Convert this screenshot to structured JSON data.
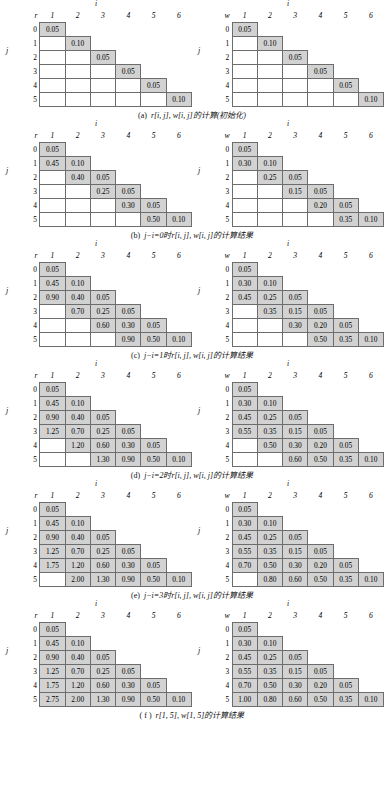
{
  "figure": {
    "col_headers": [
      "1",
      "2",
      "3",
      "4",
      "5",
      "6"
    ],
    "row_labels": [
      "0",
      "1",
      "2",
      "3",
      "4",
      "5"
    ],
    "axis_i": "i",
    "axis_j": "j",
    "symbol_r": "r",
    "symbol_w": "w"
  },
  "panels": [
    {
      "id": "a",
      "caption_label": "(a)",
      "caption_text": "r[i, j], w[i, j]的计算(初始化)",
      "left": {
        "corner": "r",
        "rows": [
          [
            "0.05",
            "",
            "",
            "",
            "",
            ""
          ],
          [
            "",
            "0.10",
            "",
            "",
            "",
            ""
          ],
          [
            "",
            "",
            "0.05",
            "",
            "",
            ""
          ],
          [
            "",
            "",
            "",
            "0.05",
            "",
            ""
          ],
          [
            "",
            "",
            "",
            "",
            "0.05",
            ""
          ],
          [
            "",
            "",
            "",
            "",
            "",
            "0.10"
          ]
        ]
      },
      "right": {
        "corner": "w",
        "rows": [
          [
            "0.05",
            "",
            "",
            "",
            "",
            ""
          ],
          [
            "",
            "0.10",
            "",
            "",
            "",
            ""
          ],
          [
            "",
            "",
            "0.05",
            "",
            "",
            ""
          ],
          [
            "",
            "",
            "",
            "0.05",
            "",
            ""
          ],
          [
            "",
            "",
            "",
            "",
            "0.05",
            ""
          ],
          [
            "",
            "",
            "",
            "",
            "",
            "0.10"
          ]
        ]
      }
    },
    {
      "id": "b",
      "caption_label": "(b)",
      "caption_text": "j−i=0时r[i, j], w[i, j]的计算结果",
      "left": {
        "corner": "r",
        "rows": [
          [
            "0.05",
            "",
            "",
            "",
            "",
            ""
          ],
          [
            "0.45",
            "0.10",
            "",
            "",
            "",
            ""
          ],
          [
            "",
            "0.40",
            "0.05",
            "",
            "",
            ""
          ],
          [
            "",
            "",
            "0.25",
            "0.05",
            "",
            ""
          ],
          [
            "",
            "",
            "",
            "0.30",
            "0.05",
            ""
          ],
          [
            "",
            "",
            "",
            "",
            "0.50",
            "0.10"
          ]
        ]
      },
      "right": {
        "corner": "w",
        "rows": [
          [
            "0.05",
            "",
            "",
            "",
            "",
            ""
          ],
          [
            "0.30",
            "0.10",
            "",
            "",
            "",
            ""
          ],
          [
            "",
            "0.25",
            "0.05",
            "",
            "",
            ""
          ],
          [
            "",
            "",
            "0.15",
            "0.05",
            "",
            ""
          ],
          [
            "",
            "",
            "",
            "0.20",
            "0.05",
            ""
          ],
          [
            "",
            "",
            "",
            "",
            "0.35",
            "0.10"
          ]
        ]
      }
    },
    {
      "id": "c",
      "caption_label": "(c)",
      "caption_text": "j−i=1时r[i, j], w[i, j]的计算结果",
      "left": {
        "corner": "r",
        "rows": [
          [
            "0.05",
            "",
            "",
            "",
            "",
            ""
          ],
          [
            "0.45",
            "0.10",
            "",
            "",
            "",
            ""
          ],
          [
            "0.90",
            "0.40",
            "0.05",
            "",
            "",
            ""
          ],
          [
            "",
            "0.70",
            "0.25",
            "0.05",
            "",
            ""
          ],
          [
            "",
            "",
            "0.60",
            "0.30",
            "0.05",
            ""
          ],
          [
            "",
            "",
            "",
            "0.90",
            "0.50",
            "0.10"
          ]
        ]
      },
      "right": {
        "corner": "w",
        "rows": [
          [
            "0.05",
            "",
            "",
            "",
            "",
            ""
          ],
          [
            "0.30",
            "0.10",
            "",
            "",
            "",
            ""
          ],
          [
            "0.45",
            "0.25",
            "0.05",
            "",
            "",
            ""
          ],
          [
            "",
            "0.35",
            "0.15",
            "0.05",
            "",
            ""
          ],
          [
            "",
            "",
            "0.30",
            "0.20",
            "0.05",
            ""
          ],
          [
            "",
            "",
            "",
            "0.50",
            "0.35",
            "0.10"
          ]
        ]
      }
    },
    {
      "id": "d",
      "caption_label": "(d)",
      "caption_text": "j−i=2时r[i, j], w[i, j]的计算结果",
      "left": {
        "corner": "r",
        "rows": [
          [
            "0.05",
            "",
            "",
            "",
            "",
            ""
          ],
          [
            "0.45",
            "0.10",
            "",
            "",
            "",
            ""
          ],
          [
            "0.90",
            "0.40",
            "0.05",
            "",
            "",
            ""
          ],
          [
            "1.25",
            "0.70",
            "0.25",
            "0.05",
            "",
            ""
          ],
          [
            "",
            "1.20",
            "0.60",
            "0.30",
            "0.05",
            ""
          ],
          [
            "",
            "",
            "1.30",
            "0.90",
            "0.50",
            "0.10"
          ]
        ]
      },
      "right": {
        "corner": "w",
        "rows": [
          [
            "0.05",
            "",
            "",
            "",
            "",
            ""
          ],
          [
            "0.30",
            "0.10",
            "",
            "",
            "",
            ""
          ],
          [
            "0.45",
            "0.25",
            "0.05",
            "",
            "",
            ""
          ],
          [
            "0.55",
            "0.35",
            "0.15",
            "0.05",
            "",
            ""
          ],
          [
            "",
            "0.50",
            "0.30",
            "0.20",
            "0.05",
            ""
          ],
          [
            "",
            "",
            "0.60",
            "0.50",
            "0.35",
            "0.10"
          ]
        ]
      }
    },
    {
      "id": "e",
      "caption_label": "(e)",
      "caption_text": "j−i=3时r[i, j], w[i, j]的计算结果",
      "left": {
        "corner": "r",
        "rows": [
          [
            "0.05",
            "",
            "",
            "",
            "",
            ""
          ],
          [
            "0.45",
            "0.10",
            "",
            "",
            "",
            ""
          ],
          [
            "0.90",
            "0.40",
            "0.05",
            "",
            "",
            ""
          ],
          [
            "1.25",
            "0.70",
            "0.25",
            "0.05",
            "",
            ""
          ],
          [
            "1.75",
            "1.20",
            "0.60",
            "0.30",
            "0.05",
            ""
          ],
          [
            "",
            "2.00",
            "1.30",
            "0.90",
            "0.50",
            "0.10"
          ]
        ]
      },
      "right": {
        "corner": "w",
        "rows": [
          [
            "0.05",
            "",
            "",
            "",
            "",
            ""
          ],
          [
            "0.30",
            "0.10",
            "",
            "",
            "",
            ""
          ],
          [
            "0.45",
            "0.25",
            "0.05",
            "",
            "",
            ""
          ],
          [
            "0.55",
            "0.35",
            "0.15",
            "0.05",
            "",
            ""
          ],
          [
            "0.70",
            "0.50",
            "0.30",
            "0.20",
            "0.05",
            ""
          ],
          [
            "",
            "0.80",
            "0.60",
            "0.50",
            "0.35",
            "0.10"
          ]
        ]
      }
    },
    {
      "id": "f",
      "caption_label": "( f )",
      "caption_text": "r[1, 5], w[1, 5]的计算结果",
      "left": {
        "corner": "r",
        "rows": [
          [
            "0.05",
            "",
            "",
            "",
            "",
            ""
          ],
          [
            "0.45",
            "0.10",
            "",
            "",
            "",
            ""
          ],
          [
            "0.90",
            "0.40",
            "0.05",
            "",
            "",
            ""
          ],
          [
            "1.25",
            "0.70",
            "0.25",
            "0.05",
            "",
            ""
          ],
          [
            "1.75",
            "1.20",
            "0.60",
            "0.30",
            "0.05",
            ""
          ],
          [
            "2.75",
            "2.00",
            "1.30",
            "0.90",
            "0.50",
            "0.10"
          ]
        ]
      },
      "right": {
        "corner": "w",
        "rows": [
          [
            "0.05",
            "",
            "",
            "",
            "",
            ""
          ],
          [
            "0.30",
            "0.10",
            "",
            "",
            "",
            ""
          ],
          [
            "0.45",
            "0.25",
            "0.05",
            "",
            "",
            ""
          ],
          [
            "0.55",
            "0.35",
            "0.15",
            "0.05",
            "",
            ""
          ],
          [
            "0.70",
            "0.50",
            "0.30",
            "0.20",
            "0.05",
            ""
          ],
          [
            "1.00",
            "0.80",
            "0.60",
            "0.50",
            "0.35",
            "0.10"
          ]
        ]
      }
    }
  ]
}
